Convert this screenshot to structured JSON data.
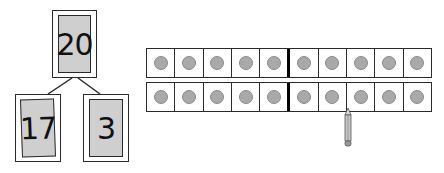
{
  "number_bond": {
    "whole": "20",
    "parts": [
      "17",
      "3"
    ]
  },
  "ten_frame": {
    "rows": 2,
    "columns": 10,
    "filled_counters": 20,
    "divider_after_column": 5,
    "counter_color": "#a9a9a9"
  },
  "pointer": {
    "icon": "pencil-icon",
    "points_between": "row 2, column 7 and 8"
  }
}
